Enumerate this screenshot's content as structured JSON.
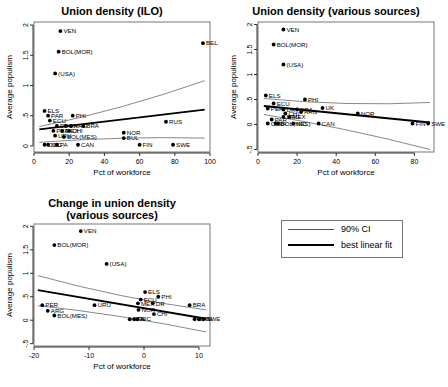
{
  "figure": {
    "xlabel": "Pct of workforce",
    "ylabel": "Average populism"
  },
  "legend": {
    "ci_label": "90% CI",
    "fit_label": "best linear fit"
  },
  "chart_data": [
    {
      "type": "scatter",
      "title": "Union density (ILO)",
      "title_line2": "",
      "xlabel": "Pct of workforce",
      "ylabel": "Average populism",
      "xlim": [
        0,
        100
      ],
      "ylim": [
        -0.1,
        2.05
      ],
      "xticks": [
        0,
        20,
        40,
        60,
        80,
        100
      ],
      "yticks": [
        0,
        0.5,
        1,
        1.5,
        2
      ],
      "ytick_labels": [
        "0",
        ".5",
        "1",
        "1.5",
        "2"
      ],
      "grid": false,
      "points": [
        {
          "label": "VEN",
          "x": 15,
          "y": 1.9
        },
        {
          "label": "BEL",
          "x": 96,
          "y": 1.7
        },
        {
          "label": "BOL(MOR)",
          "x": 14,
          "y": 1.56
        },
        {
          "label": "(USA)",
          "x": 12,
          "y": 1.2
        },
        {
          "label": "ELS",
          "x": 6,
          "y": 0.58
        },
        {
          "label": "PAR",
          "x": 8,
          "y": 0.5
        },
        {
          "label": "PHI",
          "x": 22,
          "y": 0.5
        },
        {
          "label": "ECU",
          "x": 9,
          "y": 0.42
        },
        {
          "label": "DR",
          "x": 13,
          "y": 0.33
        },
        {
          "label": "UK",
          "x": 18,
          "y": 0.33
        },
        {
          "label": "ARG",
          "x": 21,
          "y": 0.33
        },
        {
          "label": "BRA",
          "x": 28,
          "y": 0.33
        },
        {
          "label": "RUS",
          "x": 75,
          "y": 0.4
        },
        {
          "label": "PER",
          "x": 11,
          "y": 0.25
        },
        {
          "label": "MEX",
          "x": 16,
          "y": 0.25
        },
        {
          "label": "CHI",
          "x": 20,
          "y": 0.25
        },
        {
          "label": "NOR",
          "x": 51,
          "y": 0.22
        },
        {
          "label": "URU",
          "x": 12,
          "y": 0.17
        },
        {
          "label": "BOL(MES)",
          "x": 17,
          "y": 0.15
        },
        {
          "label": "BUL",
          "x": 51,
          "y": 0.13
        },
        {
          "label": "NIC",
          "x": 8,
          "y": 0.02
        },
        {
          "label": "PA",
          "x": 13,
          "y": 0.02
        },
        {
          "label": "COL",
          "x": 6,
          "y": 0.02
        },
        {
          "label": "CAN",
          "x": 25,
          "y": 0.02
        },
        {
          "label": "FIN",
          "x": 60,
          "y": 0.02
        },
        {
          "label": "SWE",
          "x": 79,
          "y": 0.02
        }
      ],
      "fit_line": {
        "x": [
          3,
          97
        ],
        "y": [
          0.275,
          0.6
        ]
      },
      "ci_upper": {
        "x": [
          3,
          97
        ],
        "y": [
          0.32,
          1.08
        ]
      },
      "ci_lower": {
        "x": [
          3,
          97
        ],
        "y": [
          0.06,
          0.13
        ]
      }
    },
    {
      "type": "scatter",
      "title": "Union density (various sources)",
      "title_line2": "",
      "xlabel": "Pct of workforce",
      "ylabel": "Average populism",
      "xlim": [
        0,
        90
      ],
      "ylim": [
        -0.55,
        2.05
      ],
      "xticks": [
        0,
        20,
        40,
        60,
        80
      ],
      "yticks": [
        -0.5,
        0,
        0.5,
        1,
        1.5,
        2
      ],
      "ytick_labels": [
        "-.5",
        "0",
        ".5",
        "1",
        "1.5",
        "2"
      ],
      "grid": false,
      "points": [
        {
          "label": "VEN",
          "x": 13,
          "y": 1.9
        },
        {
          "label": "BOL(MOR)",
          "x": 8,
          "y": 1.6
        },
        {
          "label": "(USA)",
          "x": 13,
          "y": 1.2
        },
        {
          "label": "ELS",
          "x": 4,
          "y": 0.58
        },
        {
          "label": "PHI",
          "x": 24,
          "y": 0.5
        },
        {
          "label": "ECU",
          "x": 8,
          "y": 0.42
        },
        {
          "label": "PER",
          "x": 5,
          "y": 0.32
        },
        {
          "label": "UK",
          "x": 33,
          "y": 0.33
        },
        {
          "label": "DR",
          "x": 13,
          "y": 0.3
        },
        {
          "label": "BRA",
          "x": 20,
          "y": 0.3
        },
        {
          "label": "ARG",
          "x": 22,
          "y": 0.25
        },
        {
          "label": "CHI",
          "x": 14,
          "y": 0.22
        },
        {
          "label": "NOR",
          "x": 51,
          "y": 0.22
        },
        {
          "label": "URU",
          "x": 13,
          "y": 0.15
        },
        {
          "label": "MEX",
          "x": 16,
          "y": 0.15
        },
        {
          "label": "PAR",
          "x": 7,
          "y": 0.1
        },
        {
          "label": "COL",
          "x": 5,
          "y": 0.02
        },
        {
          "label": "NIC",
          "x": 18,
          "y": 0.02
        },
        {
          "label": "CAN",
          "x": 31,
          "y": 0.02
        },
        {
          "label": "BOL(MES)",
          "x": 10,
          "y": 0.02
        },
        {
          "label": "PA",
          "x": 9,
          "y": 0.02
        },
        {
          "label": "FIN",
          "x": 79,
          "y": 0.02
        },
        {
          "label": "SWE",
          "x": 87,
          "y": 0.02
        }
      ],
      "fit_line": {
        "x": [
          3,
          88
        ],
        "y": [
          0.37,
          0.04
        ]
      },
      "ci_upper": {
        "x": [
          3,
          88
        ],
        "y": [
          0.52,
          0.44
        ]
      },
      "ci_lower": {
        "x": [
          3,
          88
        ],
        "y": [
          0.2,
          -0.5
        ]
      }
    },
    {
      "type": "scatter",
      "title": "Change in union density",
      "title_line2": "(various sources)",
      "xlabel": "Pct of workforce",
      "ylabel": "Average populism",
      "xlim": [
        -20,
        12
      ],
      "ylim": [
        -0.55,
        2.05
      ],
      "xticks": [
        -20,
        -10,
        0,
        10
      ],
      "yticks": [
        -0.5,
        0,
        0.5,
        1,
        1.5,
        2
      ],
      "ytick_labels": [
        "-.5",
        "0",
        ".5",
        "1",
        "1.5",
        "2"
      ],
      "grid": false,
      "points": [
        {
          "label": "VEN",
          "x": -11.5,
          "y": 1.9
        },
        {
          "label": "BOL(MOR)",
          "x": -16.3,
          "y": 1.6
        },
        {
          "label": "(USA)",
          "x": -6.8,
          "y": 1.2
        },
        {
          "label": "ELS",
          "x": 0.2,
          "y": 0.6
        },
        {
          "label": "PHI",
          "x": 2.6,
          "y": 0.5
        },
        {
          "label": "ECU",
          "x": -0.6,
          "y": 0.44
        },
        {
          "label": "MEX",
          "x": -1.1,
          "y": 0.36
        },
        {
          "label": "DR",
          "x": 1.6,
          "y": 0.36
        },
        {
          "label": "BRA",
          "x": 8.3,
          "y": 0.32
        },
        {
          "label": "PER",
          "x": -18.5,
          "y": 0.32
        },
        {
          "label": "URU",
          "x": -9,
          "y": 0.32
        },
        {
          "label": "ARG",
          "x": -17.5,
          "y": 0.2
        },
        {
          "label": "NOR",
          "x": -1,
          "y": 0.22
        },
        {
          "label": "CHI",
          "x": 1.8,
          "y": 0.13
        },
        {
          "label": "BOL(MES)",
          "x": -16.3,
          "y": 0.1
        },
        {
          "label": "COL",
          "x": -2.6,
          "y": 0.02
        },
        {
          "label": "PA",
          "x": -1.8,
          "y": 0.02
        },
        {
          "label": "NIC",
          "x": -1.2,
          "y": 0.02
        },
        {
          "label": "CAN",
          "x": 9.2,
          "y": 0.02
        },
        {
          "label": "FIN",
          "x": 10,
          "y": 0.02
        },
        {
          "label": "SWE",
          "x": 10.8,
          "y": 0.02
        }
      ],
      "fit_line": {
        "x": [
          -19.3,
          11.3
        ],
        "y": [
          0.64,
          0.03
        ]
      },
      "ci_upper": {
        "x": [
          -19.3,
          11.3
        ],
        "y": [
          0.95,
          0.22
        ]
      },
      "ci_lower": {
        "x": [
          -19.3,
          11.3
        ],
        "y": [
          0.31,
          -0.25
        ]
      }
    }
  ]
}
